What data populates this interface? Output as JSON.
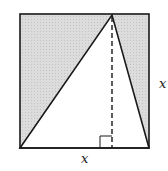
{
  "diagram": {
    "labels": {
      "bottom_side": "x",
      "right_side": "x"
    },
    "colors": {
      "shade": "#d6d6d6",
      "stroke": "#1a1a1a",
      "background": "#ffffff"
    }
  }
}
